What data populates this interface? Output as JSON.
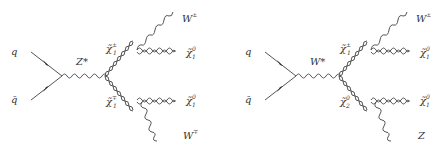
{
  "diagrams": [
    {
      "id": "left",
      "mediator": "Z*",
      "incoming": {
        "quark": "q",
        "antiquark": "q̄"
      },
      "intermediate_upper": {
        "symbol": "χ̃",
        "sub": "1",
        "sup": "±"
      },
      "intermediate_lower": {
        "symbol": "χ̃",
        "sub": "1",
        "sup": "∓"
      },
      "upper_boson": {
        "base": "W",
        "sup": "±"
      },
      "lower_boson": {
        "base": "W",
        "sup": "∓"
      },
      "upper_lsp": {
        "symbol": "χ̃",
        "sub": "1",
        "sup": "0"
      },
      "lower_lsp": {
        "symbol": "χ̃",
        "sub": "1",
        "sup": "0"
      }
    },
    {
      "id": "right",
      "mediator": "W*",
      "incoming": {
        "quark": "q",
        "antiquark": "q̄"
      },
      "intermediate_upper": {
        "symbol": "χ̃",
        "sub": "1",
        "sup": "±"
      },
      "intermediate_lower": {
        "symbol": "χ̃",
        "sub": "2",
        "sup": "0"
      },
      "upper_boson": {
        "base": "W",
        "sup": "±"
      },
      "lower_boson": {
        "base": "Z",
        "sup": ""
      },
      "upper_lsp": {
        "symbol": "χ̃",
        "sub": "1",
        "sup": "0"
      },
      "lower_lsp": {
        "symbol": "χ̃",
        "sub": "1",
        "sup": "0"
      }
    }
  ],
  "colors": {
    "line": "#555555",
    "text": "#333333",
    "background": "#ffffff"
  }
}
